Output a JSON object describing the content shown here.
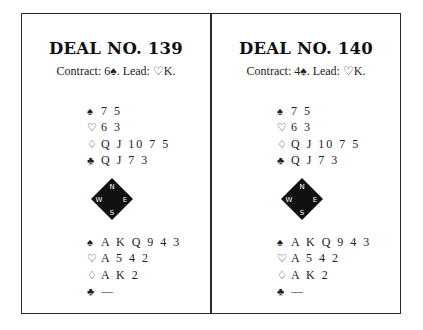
{
  "deals": [
    {
      "title": "DEAL NO. 139",
      "contract": "Contract: 6♠. Lead: ♡K.",
      "north": [
        {
          "suit": "♠",
          "suit_name": "spades",
          "cards": "7 5"
        },
        {
          "suit": "♡",
          "suit_name": "hearts",
          "cards": "6 3"
        },
        {
          "suit": "♢",
          "suit_name": "diamonds",
          "cards": "Q J 10 7 5"
        },
        {
          "suit": "♣",
          "suit_name": "clubs",
          "cards": "Q J 7 3"
        }
      ],
      "compass": {
        "n": "N",
        "e": "E",
        "s": "S",
        "w": "W"
      },
      "south": [
        {
          "suit": "♠",
          "suit_name": "spades",
          "cards": "A K Q 9 4 3"
        },
        {
          "suit": "♡",
          "suit_name": "hearts",
          "cards": "A 5 4 2"
        },
        {
          "suit": "♢",
          "suit_name": "diamonds",
          "cards": "A K 2"
        },
        {
          "suit": "♣",
          "suit_name": "clubs",
          "cards": "—"
        }
      ]
    },
    {
      "title": "DEAL NO. 140",
      "contract": "Contract: 4♠. Lead: ♡K.",
      "north": [
        {
          "suit": "♠",
          "suit_name": "spades",
          "cards": "7 5"
        },
        {
          "suit": "♡",
          "suit_name": "hearts",
          "cards": "6 3"
        },
        {
          "suit": "♢",
          "suit_name": "diamonds",
          "cards": "Q J 10 7 5"
        },
        {
          "suit": "♣",
          "suit_name": "clubs",
          "cards": "Q J 7 3"
        }
      ],
      "compass": {
        "n": "N",
        "e": "E",
        "s": "S",
        "w": "W"
      },
      "south": [
        {
          "suit": "♠",
          "suit_name": "spades",
          "cards": "A K Q 9 4 3"
        },
        {
          "suit": "♡",
          "suit_name": "hearts",
          "cards": "A 5 4 2"
        },
        {
          "suit": "♢",
          "suit_name": "diamonds",
          "cards": "A K 2"
        },
        {
          "suit": "♣",
          "suit_name": "clubs",
          "cards": "—"
        }
      ]
    }
  ]
}
